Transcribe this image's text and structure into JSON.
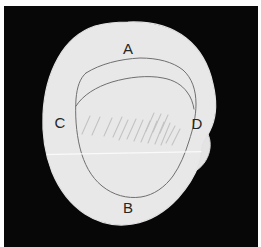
{
  "figure": {
    "width": 261,
    "height": 247
  },
  "colors": {
    "page_background": "#fdfdfd",
    "panel_background": "#070707",
    "blob_fill": "#e8e8e8",
    "blob_edge": "#e2e2e2",
    "contour_line": "#6f6f6f",
    "hatch_line": "#c3c3c3",
    "label_text": "#262626",
    "scanline": "#fbfbfb",
    "border": "#ffffff"
  },
  "panel": {
    "x": 4,
    "y": 6,
    "width": 254,
    "height": 241
  },
  "labels": [
    {
      "id": "A",
      "text": "A",
      "x": 128,
      "y": 50,
      "note": "superior / top region"
    },
    {
      "id": "B",
      "text": "B",
      "x": 128,
      "y": 209,
      "note": "inferior / bottom region"
    },
    {
      "id": "C",
      "text": "C",
      "x": 60,
      "y": 124,
      "note": "left lateral region"
    },
    {
      "id": "D",
      "text": "D",
      "x": 197,
      "y": 125,
      "note": "right lateral region"
    }
  ],
  "shapes": {
    "outer_blob_path": "M 128 22 C 152 21 172 27 186 38 C 200 49 209 65 213 84 C 217 101 216 116 212 126 C 209 134 205 139 203 144 C 201 150 202 156 199 164 C 195 175 188 187 178 198 C 166 211 150 221 133 224 C 116 227 99 223 85 214 C 70 204 59 189 52 172 C 45 154 42 134 43 114 C 44 93 49 74 58 58 C 67 42 80 31 95 26 C 106 23 117 22 128 22 Z",
    "inner_contour_path": "M 86 73 C 100 64 120 59 140 58 C 158 58 173 62 183 70 C 192 78 196 90 196 104 C 196 116 193 129 189 141 C 185 154 180 166 173 176 C 165 187 154 195 141 197 C 127 199 113 195 102 186 C 91 177 84 164 80 148 C 76 132 75 114 76 99 C 77 87 80 78 86 73 Z",
    "secondary_arc_path": "M 76 106 C 83 95 96 87 112 82 C 129 77 148 75 163 78 C 174 80 182 85 187 92 C 191 97 193 103 194 109",
    "right_notch_path": "M 203 128 C 208 132 211 139 210 148 C 209 157 204 165 197 170 C 192 174 187 176 183 176",
    "scanline": {
      "x1": 24,
      "y1": 155,
      "x2": 238,
      "y2": 151
    }
  },
  "hatching": {
    "count": 16,
    "angle_deg": -58,
    "region_note": "diagonal hatch strokes filling the mid-band of the inner contour",
    "strokes": [
      {
        "x1": 82,
        "y1": 134,
        "x2": 90,
        "y2": 116
      },
      {
        "x1": 92,
        "y1": 135,
        "x2": 100,
        "y2": 117
      },
      {
        "x1": 104,
        "y1": 136,
        "x2": 112,
        "y2": 118
      },
      {
        "x1": 113,
        "y1": 137,
        "x2": 122,
        "y2": 117
      },
      {
        "x1": 119,
        "y1": 140,
        "x2": 128,
        "y2": 120
      },
      {
        "x1": 127,
        "y1": 139,
        "x2": 136,
        "y2": 119
      },
      {
        "x1": 134,
        "y1": 141,
        "x2": 143,
        "y2": 120
      },
      {
        "x1": 141,
        "y1": 142,
        "x2": 150,
        "y2": 121
      },
      {
        "x1": 148,
        "y1": 143,
        "x2": 157,
        "y2": 121
      },
      {
        "x1": 155,
        "y1": 144,
        "x2": 164,
        "y2": 122
      },
      {
        "x1": 161,
        "y1": 145,
        "x2": 170,
        "y2": 123
      },
      {
        "x1": 146,
        "y1": 131,
        "x2": 154,
        "y2": 113
      },
      {
        "x1": 153,
        "y1": 132,
        "x2": 161,
        "y2": 114
      },
      {
        "x1": 160,
        "y1": 133,
        "x2": 168,
        "y2": 115
      },
      {
        "x1": 166,
        "y1": 143,
        "x2": 175,
        "y2": 126
      },
      {
        "x1": 172,
        "y1": 145,
        "x2": 180,
        "y2": 129
      }
    ]
  }
}
